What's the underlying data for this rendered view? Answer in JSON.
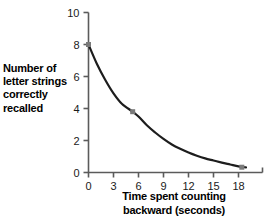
{
  "chart_data": {
    "type": "line",
    "title": "",
    "subtitle": "",
    "xlabel_line1": "Time spent counting",
    "xlabel_line2": "backward (seconds)",
    "xlabel": "Time spent counting backward (seconds)",
    "ylabel_line1": "Number of",
    "ylabel_line2": "letter strings",
    "ylabel_line3": "correctly",
    "ylabel_line4": "recalled",
    "ylabel": "Number of letter strings correctly recalled",
    "xlim": [
      0,
      19.8
    ],
    "ylim": [
      0,
      10
    ],
    "xticks": [
      0,
      3,
      6,
      9,
      12,
      15,
      18
    ],
    "xtick_labels": [
      "0",
      "3",
      "6",
      "9",
      "12",
      "15",
      "18"
    ],
    "yticks": [
      0,
      2,
      4,
      6,
      8,
      10
    ],
    "ytick_labels": [
      "0",
      "2",
      "4",
      "6",
      "8",
      "10"
    ],
    "grid": false,
    "legend": false,
    "legend_position": "none",
    "series": [
      {
        "name": "Recall",
        "x": [
          0,
          1,
          2,
          3,
          4,
          5.3,
          6,
          7,
          8,
          9,
          10,
          11,
          12,
          13,
          14,
          15,
          16,
          17,
          18,
          18.9
        ],
        "y": [
          8.0,
          6.8,
          5.8,
          4.95,
          4.3,
          3.8,
          3.5,
          2.95,
          2.5,
          2.1,
          1.75,
          1.48,
          1.25,
          1.05,
          0.88,
          0.75,
          0.62,
          0.5,
          0.38,
          0.32
        ],
        "line_color": "#1d1d1d",
        "line_width": 2.2,
        "marker": "square",
        "marker_color": "#7a7a7a"
      }
    ],
    "markers": [
      {
        "x": 0,
        "y": 8.0
      },
      {
        "x": 5.3,
        "y": 3.8
      },
      {
        "x": 18.4,
        "y": 0.33
      }
    ],
    "axis_color": "#5b5b5b",
    "text_color": "#000000",
    "background_color": "#ffffff"
  }
}
